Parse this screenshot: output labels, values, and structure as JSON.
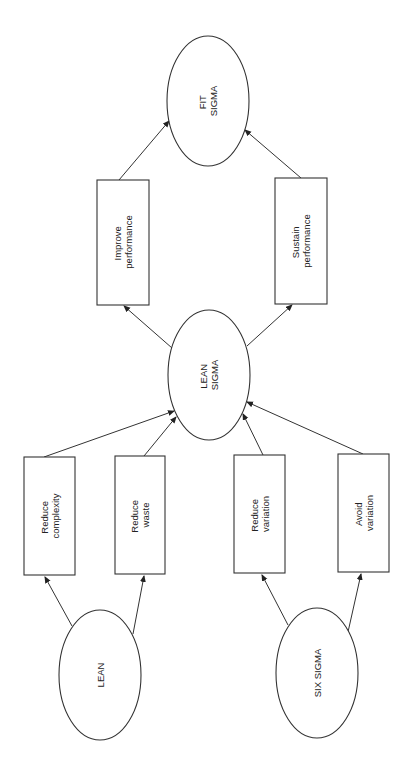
{
  "diagram": {
    "orientation": "rotated-90-ccw",
    "nodes": {
      "lean": {
        "lines": [
          "LEAN"
        ],
        "shape": "ellipse"
      },
      "six_sigma": {
        "lines": [
          "SIX SIGMA"
        ],
        "shape": "ellipse"
      },
      "reduce_complexity": {
        "lines": [
          "Reduce",
          "complexity"
        ],
        "shape": "rect"
      },
      "reduce_waste": {
        "lines": [
          "Reduce",
          "waste"
        ],
        "shape": "rect"
      },
      "reduce_variation": {
        "lines": [
          "Reduce",
          "variation"
        ],
        "shape": "rect"
      },
      "avoid_variation": {
        "lines": [
          "Avoid",
          "variation"
        ],
        "shape": "rect"
      },
      "lean_sigma": {
        "lines": [
          "LEAN",
          "SIGMA"
        ],
        "shape": "ellipse"
      },
      "improve_performance": {
        "lines": [
          "Improve",
          "performance"
        ],
        "shape": "rect"
      },
      "sustain_performance": {
        "lines": [
          "Sustain",
          "performance"
        ],
        "shape": "rect"
      },
      "fit_sigma": {
        "lines": [
          "FIT",
          "SIGMA"
        ],
        "shape": "ellipse"
      }
    },
    "edges": [
      [
        "LEAN",
        "Reduce complexity"
      ],
      [
        "LEAN",
        "Reduce waste"
      ],
      [
        "SIX SIGMA",
        "Reduce variation"
      ],
      [
        "SIX SIGMA",
        "Avoid variation"
      ],
      [
        "Reduce complexity",
        "LEAN SIGMA"
      ],
      [
        "Reduce waste",
        "LEAN SIGMA"
      ],
      [
        "Reduce variation",
        "LEAN SIGMA"
      ],
      [
        "Avoid variation",
        "LEAN SIGMA"
      ],
      [
        "LEAN SIGMA",
        "Improve performance"
      ],
      [
        "LEAN SIGMA",
        "Sustain performance"
      ],
      [
        "Improve performance",
        "FIT SIGMA"
      ],
      [
        "Sustain performance",
        "FIT SIGMA"
      ]
    ],
    "colors": {
      "stroke": "#333333",
      "background": "#ffffff",
      "text": "#222222"
    }
  }
}
